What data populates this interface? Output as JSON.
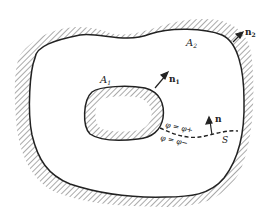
{
  "diagram": {
    "type": "region with inner and outer boundaries and a cut",
    "colors": {
      "ink": "#222222",
      "background": "#ffffff"
    },
    "labels": {
      "outer_boundary": "A",
      "outer_boundary_sub": "2",
      "inner_boundary": "A",
      "inner_boundary_sub": "1",
      "outer_normal": "n",
      "outer_normal_sub": "2",
      "inner_normal": "n",
      "inner_normal_sub": "1",
      "cut_normal": "n",
      "cut_name": "S",
      "phi_plus": "φ = φ+",
      "phi_minus": "φ = φ−"
    }
  }
}
